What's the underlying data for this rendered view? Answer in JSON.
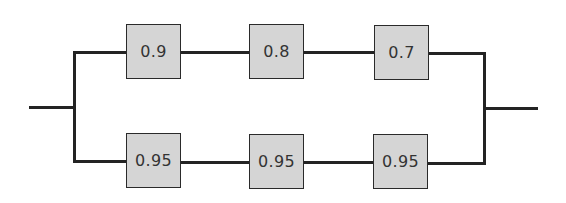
{
  "diagram": {
    "type": "reliability-block-diagram",
    "colors": {
      "wire": "#232323",
      "box_fill": "#d5d5d5",
      "box_border": "#2a2a2a",
      "text": "#333333",
      "background": "#ffffff"
    },
    "top_path": {
      "components": [
        {
          "label": "0.9"
        },
        {
          "label": "0.8"
        },
        {
          "label": "0.7"
        }
      ]
    },
    "bottom_path": {
      "components": [
        {
          "label": "0.95"
        },
        {
          "label": "0.95"
        },
        {
          "label": "0.95"
        }
      ]
    }
  }
}
